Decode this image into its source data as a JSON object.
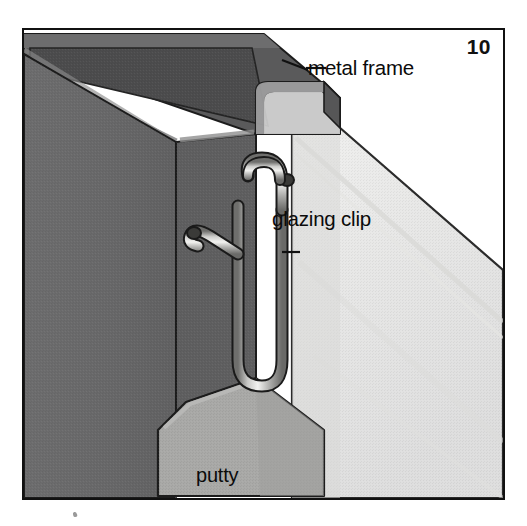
{
  "figure": {
    "number": "10",
    "background_color": "#ffffff",
    "border_color": "#111111"
  },
  "callouts": [
    {
      "id": "metal-frame",
      "label": "metal frame",
      "leader": "horizontal line from text left edge to frame top face",
      "text_color": "#0b0b0b"
    },
    {
      "id": "glazing-clip",
      "label": "glazing clip",
      "leader": "short horizontal tick to clip wire",
      "text_color": "#0b0b0b"
    },
    {
      "id": "putty",
      "label": "putty",
      "leader": "none — label sits inside the putty body",
      "text_color": "#0b0b0b"
    }
  ],
  "parts": [
    {
      "name": "metal-frame",
      "description": "Dark grey extruded metal window frame shown in isometric view with a top face, a front-left face and a narrow right return face forming the glazing channel.",
      "colors": {
        "top_face": "#59595a",
        "top_face_inner": "#4a4a4b",
        "front_face": "#6b6b6c",
        "front_face_shadow": "#5a5a5b",
        "channel_lip": "#8a8a8a",
        "bevel_highlight": "#9a9a9a",
        "right_return": "#6f6f70",
        "outline": "#1c1c1c"
      }
    },
    {
      "name": "glass-pane",
      "description": "Large translucent pale pane running diagonally down to the right behind the frame channel.",
      "colors": {
        "face": "#ececeb",
        "face_shadow": "#e0e0df",
        "edge": "#d6d6d4",
        "outline": "#2a2a2a"
      }
    },
    {
      "name": "glazing-clip",
      "description": "Bright steel spring wire clip bent into a double hook: an upper hook curving to the right over the frame lip, a long vertical shank, a U bend at the bottom and a second small hook pointing up-left into the frame.",
      "colors": {
        "wire_light": "#e8e8e6",
        "wire_mid": "#b4b4b2",
        "wire_dark": "#6a6a68",
        "outline": "#1a1a1a"
      }
    },
    {
      "name": "putty",
      "description": "Mid-grey putty fillet packed into the bottom of the glazing rebate, drawn as a pentagonal block with bevelled top corners.",
      "colors": {
        "face": "#a9a9a7",
        "face_right": "#9d9d9b",
        "outline": "#1c1c1c"
      }
    }
  ]
}
